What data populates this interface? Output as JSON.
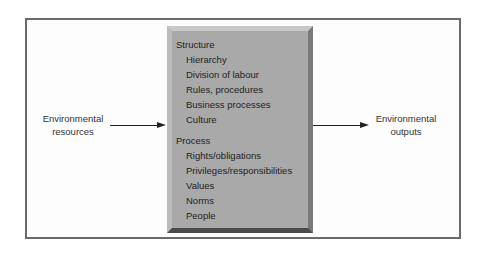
{
  "diagram": {
    "input_label": [
      "Environmental",
      "resources"
    ],
    "output_label": [
      "Environmental",
      "outputs"
    ],
    "center": {
      "sections": [
        {
          "title": "Structure",
          "items": [
            "Hierarchy",
            "Division of labour",
            "Rules, procedures",
            "Business processes",
            "Culture"
          ]
        },
        {
          "title": "Process",
          "items": [
            "Rights/obligations",
            "Privileges/responsibilities",
            "Values",
            "Norms",
            "People"
          ]
        }
      ]
    }
  }
}
